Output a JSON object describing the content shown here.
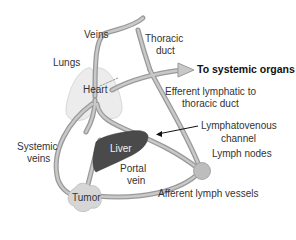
{
  "diagram": {
    "colors": {
      "vessel": "#9a9a9a",
      "vessel_inner": "#c4c4c4",
      "lungs": "#ececec",
      "liver": "#4a4a4a",
      "tumor": "#d6d6d6",
      "lymph_node": "#bdbdbd",
      "arrow_fill": "#c8c8c8",
      "text": "#333333"
    },
    "labels": {
      "veins": "Veins",
      "thoracic_duct_line1": "Thoracic",
      "thoracic_duct_line2": "duct",
      "lungs": "Lungs",
      "heart": "Heart",
      "to_systemic_organs": "To systemic organs",
      "efferent_line1": "Efferent lymphatic to",
      "efferent_line2": "thoracic duct",
      "lymphatovenous_line1": "Lymphatovenous",
      "lymphatovenous_line2": "channel",
      "systemic_veins_line1": "Systemic",
      "systemic_veins_line2": "veins",
      "liver": "Liver",
      "portal_vein_line1": "Portal",
      "portal_vein_line2": "vein",
      "lymph_nodes": "Lymph nodes",
      "tumor": "Tumor",
      "afferent_lymph_vessels": "Afferent lymph vessels"
    }
  }
}
